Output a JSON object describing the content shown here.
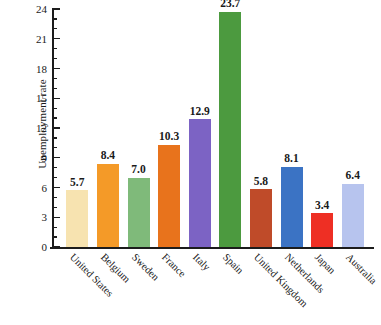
{
  "chart_data": {
    "type": "bar",
    "title": "",
    "xlabel": "",
    "ylabel": "Unemployment rate",
    "ylim": [
      0,
      24
    ],
    "ytick_step": 3,
    "yminor_step": 1,
    "grid": false,
    "legend": "none",
    "categories": [
      "United States",
      "Belgium",
      "Sweden",
      "France",
      "Italy",
      "Spain",
      "United Kingdom",
      "Netherlands",
      "Japan",
      "Australia"
    ],
    "values": [
      5.7,
      8.4,
      7.0,
      10.3,
      12.9,
      23.7,
      5.8,
      8.1,
      3.4,
      6.4
    ],
    "value_labels": [
      "5.7",
      "8.4",
      "7.0",
      "10.3",
      "12.9",
      "23.7",
      "5.8",
      "8.1",
      "3.4",
      "6.4"
    ],
    "ytick_labels": [
      "0",
      "3",
      "6",
      "9",
      "12",
      "15",
      "18",
      "21",
      "24"
    ],
    "ytick_values": [
      0,
      3,
      6,
      9,
      12,
      15,
      18,
      21,
      24
    ],
    "bar_colors": [
      "#F7E3B0",
      "#F49A28",
      "#7FBA7A",
      "#E8731C",
      "#7C63C4",
      "#4C9A3F",
      "#BF4B29",
      "#3B73C4",
      "#EE2F24",
      "#B7C4EE"
    ],
    "axis_color": "#1c1c1c",
    "background": "#ffffff"
  }
}
